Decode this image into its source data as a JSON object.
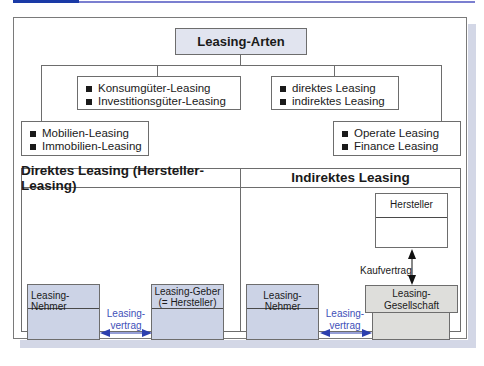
{
  "diagram": {
    "title": "Leasing-Arten",
    "categories": [
      {
        "id": "object",
        "items": [
          "Mobilien-Leasing",
          "Immobilien-Leasing"
        ]
      },
      {
        "id": "goods",
        "items": [
          "Konsumgüter-Leasing",
          "Investitionsgüter-Leasing"
        ]
      },
      {
        "id": "relation",
        "items": [
          "direktes Leasing",
          "indirektes Leasing"
        ]
      },
      {
        "id": "contract",
        "items": [
          "Operate Leasing",
          "Finance Leasing"
        ]
      }
    ],
    "direct": {
      "header": "Direktes Leasing (Hersteller-Leasing)",
      "lessee": "Leasing-Nehmer",
      "lessor_line1": "Leasing-Geber",
      "lessor_line2": "(= Hersteller)",
      "contract_line1": "Leasing-",
      "contract_line2": "vertrag"
    },
    "indirect": {
      "header": "Indirektes Leasing",
      "manufacturer": "Hersteller",
      "purchase_contract": "Kaufvertrag",
      "lessee": "Leasing-Nehmer",
      "company_line1": "Leasing-",
      "company_line2": "Gesellschaft",
      "contract_line1": "Leasing-",
      "contract_line2": "vertrag"
    }
  },
  "colors": {
    "accent_blue": "#1a3aa6",
    "entity_blue": "#ccd3e6",
    "entity_grey": "#dededb",
    "title_fill": "#e1e4ef",
    "arrow_blue": "#2c3fae"
  }
}
